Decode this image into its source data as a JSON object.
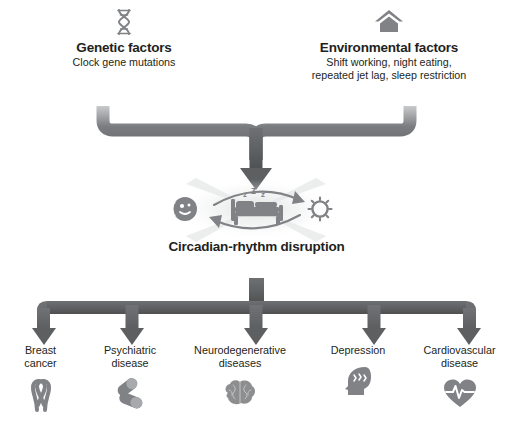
{
  "diagram": {
    "colors": {
      "arrow_dark": "#5d5f61",
      "arrow_light": "#9b9da0",
      "icon_gray": "#808285",
      "text": "#231f20",
      "background": "#ffffff"
    }
  },
  "sources": [
    {
      "id": "genetic",
      "icon": "dna-helix-icon",
      "title": "Genetic factors",
      "subtitle": "Clock gene mutations"
    },
    {
      "id": "environmental",
      "icon": "house-icon",
      "title": "Environmental factors",
      "subtitle_line1": "Shift working, night eating,",
      "subtitle_line2": "repeated jet lag, sleep restriction"
    }
  ],
  "center": {
    "title": "Circadian-rhythm disruption",
    "icons": [
      "moon-icon",
      "bed-sleep-icon",
      "sun-icon",
      "cycle-arrows-icon"
    ],
    "sleep_text": "z z z"
  },
  "outcomes": [
    {
      "id": "breast-cancer",
      "line1": "Breast",
      "line2": "cancer",
      "icon": "awareness-ribbon-icon"
    },
    {
      "id": "psychiatric",
      "line1": "Psychiatric",
      "line2": "disease",
      "icon": "pills-icon"
    },
    {
      "id": "neurodegenerative",
      "line1": "Neurodegenerative",
      "line2": "diseases",
      "icon": "brain-icon"
    },
    {
      "id": "depression",
      "line1": "Depression",
      "line2": "",
      "icon": "head-lightning-icon"
    },
    {
      "id": "cardiovascular",
      "line1": "Cardiovascular",
      "line2": "disease",
      "icon": "heart-ecg-icon"
    }
  ]
}
